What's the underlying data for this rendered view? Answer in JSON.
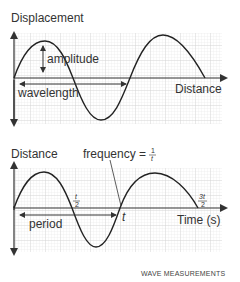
{
  "top_chart": {
    "y_axis_label": "Displacement",
    "x_axis_label": "Distance",
    "amplitude_label": "amplitude",
    "wavelength_label": "wavelength"
  },
  "bottom_chart": {
    "y_axis_label": "Distance",
    "x_axis_label": "Time (s)",
    "frequency_label": "frequency = ",
    "frequency_num": "1",
    "frequency_den": "t",
    "period_label": "period",
    "tick_half_num": "t",
    "tick_half_den": "2",
    "tick_t": "t",
    "tick_three_half_num": "3t",
    "tick_three_half_den": "2"
  },
  "caption": "WAVE MEASUREMENTS",
  "colors": {
    "curve": "#222222",
    "grid": "#d9d9d9",
    "axis": "#333333"
  }
}
